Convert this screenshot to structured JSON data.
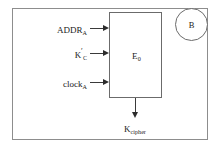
{
  "diagram": {
    "type": "block-diagram",
    "background_color": "#ffffff",
    "line_color": "#6b6b6b",
    "text_color": "#1a1a1a",
    "outer_frame": {
      "label": ""
    },
    "process_block": {
      "name": "E",
      "subscript": "0"
    },
    "entity": {
      "label": "B",
      "shape": "circle"
    },
    "inputs": [
      {
        "base": "ADDR",
        "prime": "",
        "subscript": "A"
      },
      {
        "base": "K",
        "prime": "′",
        "subscript": "C"
      },
      {
        "base": "clock",
        "prime": "",
        "subscript": "A"
      }
    ],
    "output": {
      "base": "K",
      "prime": "",
      "subscript": "cipher"
    }
  }
}
